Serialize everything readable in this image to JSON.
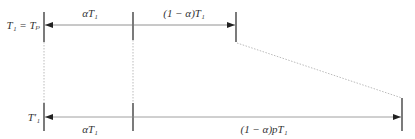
{
  "diagram": {
    "colors": {
      "line": "#555555",
      "tick": "#222222",
      "dotted": "#999999",
      "text": "#333333"
    },
    "top_row": {
      "label": "T₁ = Tₚ",
      "segments": [
        {
          "label": "αT₁"
        },
        {
          "label": "(1 − α)T₁"
        }
      ]
    },
    "bottom_row": {
      "label": "T′₁",
      "segments": [
        {
          "label": "αT₁"
        },
        {
          "label": "(1 − α)pT₁"
        }
      ]
    }
  }
}
